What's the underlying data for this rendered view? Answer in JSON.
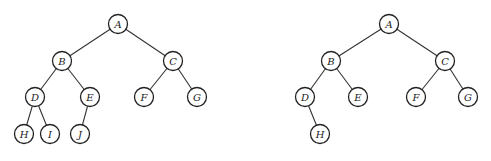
{
  "trees": [
    {
      "id": "left-tree",
      "radius": 9.5,
      "nodes": [
        {
          "label": "A",
          "x": 118,
          "y": 24
        },
        {
          "label": "B",
          "x": 62,
          "y": 61
        },
        {
          "label": "C",
          "x": 173,
          "y": 61
        },
        {
          "label": "D",
          "x": 35,
          "y": 97
        },
        {
          "label": "E",
          "x": 90,
          "y": 97
        },
        {
          "label": "F",
          "x": 144,
          "y": 97
        },
        {
          "label": "G",
          "x": 197,
          "y": 97
        },
        {
          "label": "H",
          "x": 24,
          "y": 134
        },
        {
          "label": "I",
          "x": 50,
          "y": 134
        },
        {
          "label": "J",
          "x": 80,
          "y": 134
        }
      ],
      "edges": [
        [
          "A",
          "B"
        ],
        [
          "A",
          "C"
        ],
        [
          "B",
          "D"
        ],
        [
          "B",
          "E"
        ],
        [
          "C",
          "F"
        ],
        [
          "C",
          "G"
        ],
        [
          "D",
          "H"
        ],
        [
          "D",
          "I"
        ],
        [
          "E",
          "J"
        ]
      ]
    },
    {
      "id": "right-tree",
      "radius": 9.5,
      "nodes": [
        {
          "label": "A",
          "x": 389,
          "y": 24
        },
        {
          "label": "B",
          "x": 331,
          "y": 61
        },
        {
          "label": "C",
          "x": 445,
          "y": 61
        },
        {
          "label": "D",
          "x": 305,
          "y": 97
        },
        {
          "label": "E",
          "x": 358,
          "y": 97
        },
        {
          "label": "F",
          "x": 416,
          "y": 97
        },
        {
          "label": "G",
          "x": 468,
          "y": 97
        },
        {
          "label": "H",
          "x": 320,
          "y": 134
        }
      ],
      "edges": [
        [
          "A",
          "B"
        ],
        [
          "A",
          "C"
        ],
        [
          "B",
          "D"
        ],
        [
          "B",
          "E"
        ],
        [
          "C",
          "F"
        ],
        [
          "C",
          "G"
        ],
        [
          "D",
          "H"
        ]
      ]
    }
  ]
}
